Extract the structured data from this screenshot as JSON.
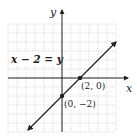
{
  "chart_data": {
    "type": "line",
    "title": "",
    "xlabel": "x",
    "ylabel": "y",
    "xlim": [
      -6,
      6
    ],
    "ylim": [
      -6,
      6
    ],
    "grid": true,
    "series": [
      {
        "name": "x − 2 = y",
        "equation": "y = x - 2",
        "x": [
          -4,
          6
        ],
        "y": [
          -6,
          4
        ],
        "arrows": "both"
      }
    ],
    "points": [
      {
        "x": 2,
        "y": 0,
        "label": "(2, 0)"
      },
      {
        "x": 0,
        "y": -2,
        "label": "(0, −2)"
      }
    ],
    "annotations": [
      {
        "text": "x − 2 = y",
        "position": "upper-left"
      }
    ]
  },
  "labels": {
    "x_axis": "x",
    "y_axis": "y",
    "equation": "x − 2 = y",
    "point_a": "(2, 0)",
    "point_b": "(0, −2)"
  },
  "colors": {
    "line": "#222222",
    "grid": "#bdbdbd",
    "axis": "#222222"
  }
}
